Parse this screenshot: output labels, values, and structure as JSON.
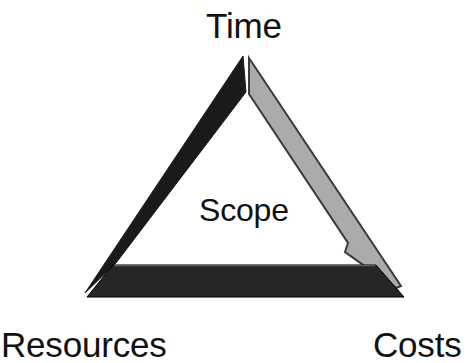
{
  "diagram": {
    "name": "Project Management Triangle",
    "background_color": "#ffffff",
    "center_label": "Scope",
    "vertices": [
      {
        "id": "time",
        "label": "Time",
        "position": "top"
      },
      {
        "id": "resources",
        "label": "Resources",
        "position": "bottom-left"
      },
      {
        "id": "costs",
        "label": "Costs",
        "position": "bottom-right"
      }
    ],
    "sides": [
      {
        "id": "left-side",
        "from": "time",
        "to": "resources",
        "color": "#1a1a1a",
        "stroke": "#1a1a1a"
      },
      {
        "id": "right-side",
        "from": "time",
        "to": "costs",
        "color": "#ababab",
        "stroke": "#3a3a3a"
      },
      {
        "id": "bottom-side",
        "from": "resources",
        "to": "costs",
        "color": "#262626",
        "stroke": "#000000"
      }
    ],
    "text_color": "#111111"
  }
}
